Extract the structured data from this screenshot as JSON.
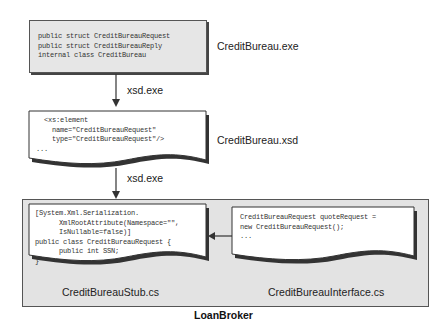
{
  "diagram": {
    "executable": {
      "code_lines": [
        "public struct CreditBureauRequest",
        "public struct CreditBureauReply",
        "internal class CreditBureau"
      ],
      "label": "CreditBureau.exe"
    },
    "step1_label": "xsd.exe",
    "schema": {
      "code_lines": [
        "  <xs:element",
        "    name=\"CreditBureauRequest\"",
        "    type=\"CreditBureauRequest\"/>",
        "..."
      ],
      "label": "CreditBureau.xsd"
    },
    "step2_label": "xsd.exe",
    "container": {
      "label": "LoanBroker",
      "stub": {
        "code_lines": [
          "[System.Xml.Serialization.",
          "      XmlRootAttribute(Namespace=\"\",",
          "      IsNullable=false)]",
          "public class CreditBureauRequest {",
          "      public int SSN;",
          "}"
        ],
        "label": "CreditBureauStub.cs"
      },
      "interface": {
        "code_lines": [
          "CreditBureauRequest quoteRequest =",
          "new CreditBureauRequest();",
          "..."
        ],
        "label": "CreditBureauInterface.cs"
      }
    },
    "colors": {
      "box_fill": "#e6e6e6",
      "container_fill": "#e3e3e3",
      "document_fill": "#ffffff",
      "stroke": "#333333"
    }
  }
}
